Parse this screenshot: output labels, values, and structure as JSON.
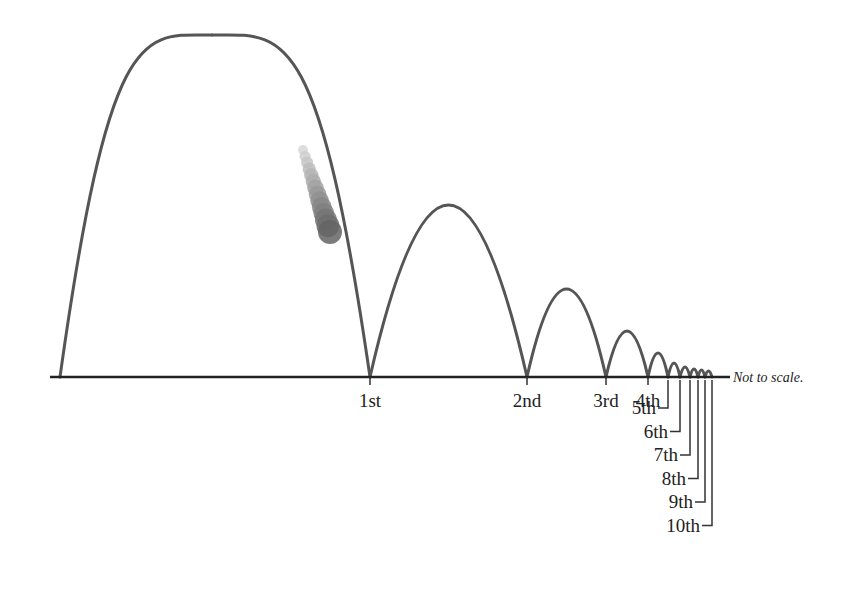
{
  "diagram": {
    "note": "Not to scale.",
    "colors": {
      "trajectory": "#555555",
      "ground": "#222222",
      "ball": "#6a6a6a",
      "text": "#222222"
    },
    "ground_y": 377,
    "ground_x": [
      50,
      730
    ],
    "start_x": 60,
    "apex_main": {
      "x": 212,
      "y": 35
    },
    "ball": {
      "x": 330,
      "y": 232,
      "r": 12
    },
    "bounces": [
      {
        "label": "1st",
        "x": 370,
        "peak_height": null
      },
      {
        "label": "2nd",
        "x": 527,
        "peak_height": 172
      },
      {
        "label": "3rd",
        "x": 606,
        "peak_height": 88
      },
      {
        "label": "4th",
        "x": 648,
        "peak_height": 46
      },
      {
        "label": "5th",
        "x": 668,
        "peak_height": 24
      },
      {
        "label": "6th",
        "x": 680,
        "peak_height": 14
      },
      {
        "label": "7th",
        "x": 690,
        "peak_height": 10
      },
      {
        "label": "8th",
        "x": 698,
        "peak_height": 8
      },
      {
        "label": "9th",
        "x": 705,
        "peak_height": 7
      },
      {
        "label": "10th",
        "x": 712,
        "peak_height": 6
      }
    ]
  }
}
